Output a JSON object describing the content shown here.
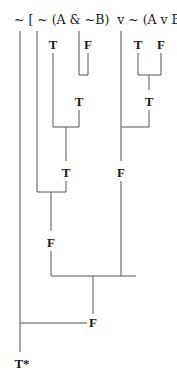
{
  "diagram": {
    "formula": "~ [ ~ (A & ~B)  v ~ (A v B)]",
    "nodes": [
      {
        "id": "A1",
        "label": "T",
        "x": 53,
        "y": 38
      },
      {
        "id": "B1",
        "label": "F",
        "x": 88,
        "y": 38
      },
      {
        "id": "A2",
        "label": "T",
        "x": 138,
        "y": 38
      },
      {
        "id": "B2",
        "label": "F",
        "x": 161,
        "y": 38
      },
      {
        "id": "notB",
        "label": "T",
        "x": 79,
        "y": 95
      },
      {
        "id": "AorB",
        "label": "T",
        "x": 149,
        "y": 95
      },
      {
        "id": "AandNotB",
        "label": "T",
        "x": 66,
        "y": 166
      },
      {
        "id": "notAorB",
        "label": "F",
        "x": 121,
        "y": 166
      },
      {
        "id": "notAandNotB",
        "label": "F",
        "x": 51,
        "y": 236
      },
      {
        "id": "disjunction",
        "label": "F",
        "x": 93,
        "y": 319
      },
      {
        "id": "result",
        "label": "T*",
        "x": 20,
        "y": 357
      }
    ]
  }
}
